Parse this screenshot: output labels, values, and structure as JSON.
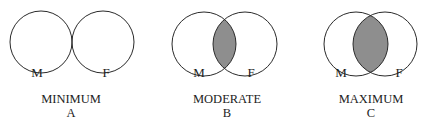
{
  "diagrams": [
    {
      "id": "A",
      "title": "MINIMUM",
      "letter": "A",
      "left_label": "M",
      "right_label": "F",
      "overlap": "minimum"
    },
    {
      "id": "B",
      "title": "MODERATE",
      "letter": "B",
      "left_label": "M",
      "right_label": "F",
      "overlap": "moderate"
    },
    {
      "id": "C",
      "title": "MAXIMUM",
      "letter": "C",
      "left_label": "M",
      "right_label": "F",
      "overlap": "maximum"
    }
  ],
  "colors": {
    "stroke": "#2a2a2a",
    "overlap_fill": "#8e8e8e",
    "background": "#ffffff"
  }
}
